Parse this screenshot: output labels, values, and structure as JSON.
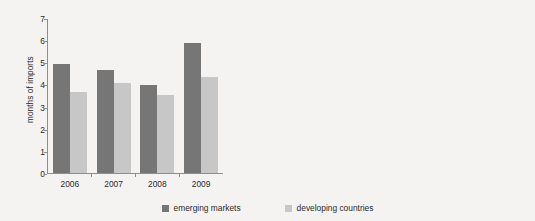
{
  "figure": {
    "background_color": "#f4f3f1",
    "dark_color": "#767676",
    "light_color": "#c7c7c7"
  },
  "legend": {
    "items": [
      {
        "label": "emerging markets",
        "color": "#767676",
        "swatch": "legend-swatch-dark"
      },
      {
        "label": "developing countries",
        "color": "#c7c7c7",
        "swatch": "legend-swatch-light"
      }
    ]
  },
  "chart_data": [
    {
      "type": "bar",
      "title": "",
      "xlabel": "",
      "ylabel": "months of imports",
      "categories": [
        "2006",
        "2007",
        "2008",
        "2009"
      ],
      "series": [
        {
          "name": "emerging markets",
          "color": "#767676",
          "values": [
            4.95,
            4.7,
            4.0,
            5.9
          ]
        },
        {
          "name": "developing countries",
          "color": "#c7c7c7",
          "values": [
            3.7,
            4.1,
            3.55,
            4.35
          ]
        }
      ],
      "ylim": [
        0,
        7
      ],
      "yticks": [
        "0",
        "1",
        "2",
        "3",
        "4",
        "5",
        "6",
        "7"
      ],
      "ytick_values": [
        0,
        1,
        2,
        3,
        4,
        5,
        6,
        7
      ],
      "grid": false,
      "legend_position": "bottom-center"
    },
    {
      "type": "bar",
      "title": "",
      "xlabel": "",
      "ylabel": "in terms of the stock of\nexternal short-term debt",
      "categories": [
        "2006",
        "2007",
        "2008",
        "2009"
      ],
      "series": [
        {
          "name": "emerging markets",
          "color": "#767676",
          "values": [
            1.42,
            1.34,
            1.61,
            2.0
          ]
        }
      ],
      "ylim": [
        0,
        2.5
      ],
      "yticks": [
        "0",
        "0.5",
        "1.0",
        "1.5",
        "2.0",
        "2.5"
      ],
      "ytick_values": [
        0,
        0.5,
        1.0,
        1.5,
        2.0,
        2.5
      ],
      "grid": false,
      "legend_position": "bottom-center"
    }
  ]
}
